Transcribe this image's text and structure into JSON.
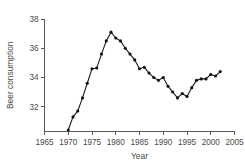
{
  "chart_data": {
    "type": "line",
    "title": "",
    "subtitle": "",
    "xlabel": "Year",
    "ylabel": "Beer consumption",
    "xlim": [
      1965,
      2005
    ],
    "ylim": [
      30.3,
      38
    ],
    "xticks": [
      1965,
      1970,
      1975,
      1980,
      1985,
      1990,
      1995,
      2000,
      2005
    ],
    "xtick_labels": [
      "1965",
      "1970",
      "1975",
      "1980",
      "1985",
      "1990",
      "1995",
      "2000",
      "2005"
    ],
    "yticks": [
      32,
      34,
      36,
      38
    ],
    "ytick_labels": [
      "32",
      "34",
      "36",
      "38"
    ],
    "grid": false,
    "legend": false,
    "legend_position": "none",
    "marker": "filled-circle",
    "line_color": "#1c1c1c",
    "marker_color": "#121212",
    "axis_color": "#595959",
    "background_color": "#ffffff",
    "x": [
      1970,
      1971,
      1972,
      1973,
      1974,
      1975,
      1976,
      1977,
      1978,
      1979,
      1980,
      1981,
      1982,
      1983,
      1984,
      1985,
      1986,
      1987,
      1988,
      1989,
      1990,
      1991,
      1992,
      1993,
      1994,
      1995,
      1996,
      1997,
      1998,
      1999,
      2000,
      2001,
      2002
    ],
    "values": [
      30.4,
      31.3,
      31.7,
      32.6,
      33.6,
      34.6,
      34.65,
      35.6,
      36.5,
      37.1,
      36.7,
      36.5,
      36.0,
      35.6,
      35.2,
      34.6,
      34.7,
      34.3,
      34.0,
      33.8,
      34.0,
      33.4,
      33.0,
      32.6,
      32.9,
      32.7,
      33.3,
      33.8,
      33.9,
      33.9,
      34.2,
      34.1,
      34.4
    ],
    "series": [
      {
        "name": "Beer consumption",
        "values": [
          30.4,
          31.3,
          31.7,
          32.6,
          33.6,
          34.6,
          34.65,
          35.6,
          36.5,
          37.1,
          36.7,
          36.5,
          36.0,
          35.6,
          35.2,
          34.6,
          34.7,
          34.3,
          34.0,
          33.8,
          34.0,
          33.4,
          33.0,
          32.6,
          32.9,
          32.7,
          33.3,
          33.8,
          33.9,
          33.9,
          34.2,
          34.1,
          34.4
        ]
      }
    ],
    "annotations": []
  }
}
